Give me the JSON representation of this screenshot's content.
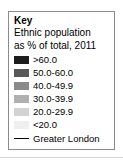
{
  "legend": {
    "title": "Key",
    "subtitle_line1": "Ethnic population",
    "subtitle_line2": "as % of total, 2011",
    "boundary": {
      "label": "Greater London",
      "color": "#000000"
    },
    "border_color": "#8b8b8b",
    "background_color": "#ffffff"
  },
  "chart_data": {
    "type": "table",
    "title": "Key",
    "subtitle": "Ethnic population as % of total, 2011",
    "xlabel": "",
    "ylabel": "",
    "legend_position": "standalone",
    "grid": false,
    "categories": [
      ">60.0",
      "50.0-60.0",
      "40.0-49.9",
      "30.0-39.9",
      "20.0-29.9",
      "<20.0"
    ],
    "values": [
      60,
      55,
      45,
      35,
      25,
      20
    ],
    "colors": [
      "#1c1c1c",
      "#585858",
      "#8a8a8a",
      "#b0b0b0",
      "#d2d2d2",
      "#efefef"
    ],
    "classes": [
      {
        "label": ">60.0",
        "color": "#1c1c1c",
        "min": 60.0,
        "max": null
      },
      {
        "label": "50.0-60.0",
        "color": "#585858",
        "min": 50.0,
        "max": 60.0
      },
      {
        "label": "40.0-49.9",
        "color": "#8a8a8a",
        "min": 40.0,
        "max": 49.9
      },
      {
        "label": "30.0-39.9",
        "color": "#b0b0b0",
        "min": 30.0,
        "max": 39.9
      },
      {
        "label": "20.0-29.9",
        "color": "#d2d2d2",
        "min": 20.0,
        "max": 29.9
      },
      {
        "label": "<20.0",
        "color": "#efefef",
        "min": null,
        "max": 20.0
      }
    ],
    "annotations": [
      "Greater London"
    ]
  }
}
